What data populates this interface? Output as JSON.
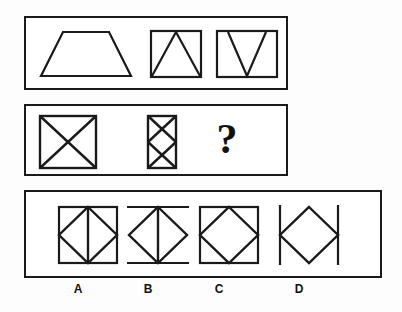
{
  "puzzle": {
    "kind": "visual-analogy-matrix",
    "stroke_color": "#1a1a1a",
    "background_color": "#ffffff",
    "question_symbol": "?"
  },
  "sequence_row": {
    "name": "sequence-row",
    "figures": [
      {
        "id": "seq-1",
        "name": "trapezoid",
        "description": "trapezoid with wide bottom and narrow top"
      },
      {
        "id": "seq-2",
        "name": "rectangle-with-inverted-v",
        "description": "rectangle containing a triangle with apex at top center"
      },
      {
        "id": "seq-3",
        "name": "rectangle-with-v",
        "description": "rectangle containing a V with apex at bottom center"
      }
    ]
  },
  "problem_row": {
    "name": "problem-row",
    "figures": [
      {
        "id": "prob-1",
        "name": "square-with-x",
        "description": "square with both diagonals forming an X"
      },
      {
        "id": "prob-2",
        "name": "tall-rectangle-with-double-x",
        "description": "tall narrow rectangle containing two stacked X shapes"
      },
      {
        "id": "prob-3",
        "name": "missing-figure",
        "description": "unknown figure indicated by a question mark"
      }
    ]
  },
  "options_row": {
    "name": "options-row",
    "options": [
      {
        "id": "opt-a",
        "label": "A",
        "name": "square-diamond-vertical-line",
        "description": "square with inscribed diamond and a vertical center line"
      },
      {
        "id": "opt-b",
        "label": "B",
        "name": "diamond-vertical-line-horizontal-bars",
        "description": "diamond with vertical center line and horizontal bars at top and bottom"
      },
      {
        "id": "opt-c",
        "label": "C",
        "name": "square-diamond",
        "description": "square with inscribed diamond, no center line"
      },
      {
        "id": "opt-d",
        "label": "D",
        "name": "diamond-vertical-side-lines",
        "description": "diamond flanked by two vertical lines at left and right"
      }
    ]
  }
}
